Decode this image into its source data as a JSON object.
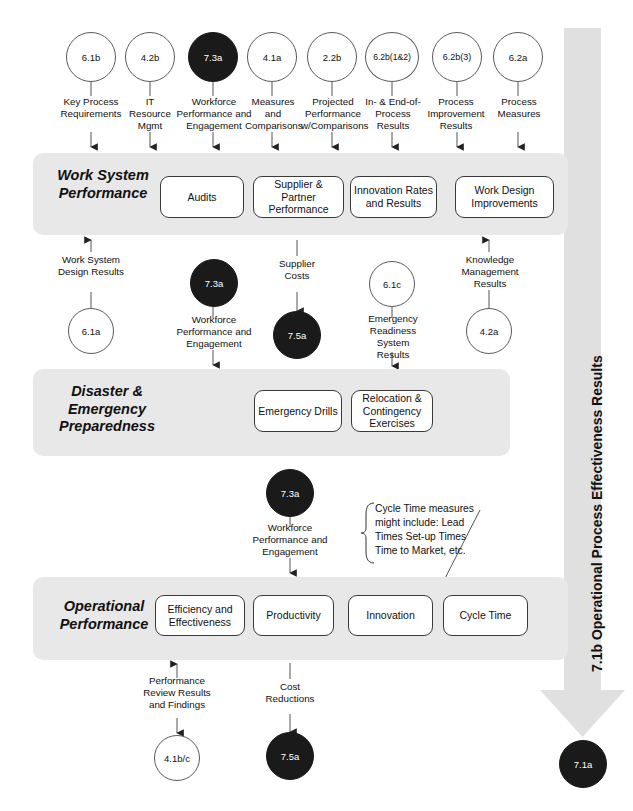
{
  "diagram": {
    "colors": {
      "band_fill": "#e8e8e8",
      "arrow_fill": "#e0e0e0",
      "node_border": "#3a3a3a",
      "circle_open_fill": "#ffffff",
      "circle_filled_fill": "#1a1a1a",
      "line": "#555555"
    }
  },
  "top_circles": [
    {
      "id": "c-6-1b",
      "label": "6.1b",
      "filled": false
    },
    {
      "id": "c-4-2b",
      "label": "4.2b",
      "filled": false
    },
    {
      "id": "c-7-3a-top",
      "label": "7.3a",
      "filled": true
    },
    {
      "id": "c-4-1a",
      "label": "4.1a",
      "filled": false
    },
    {
      "id": "c-2-2b",
      "label": "2.2b",
      "filled": false
    },
    {
      "id": "c-6-2b12",
      "label": "6.2b(1&2)",
      "filled": false
    },
    {
      "id": "c-6-2b3",
      "label": "6.2b(3)",
      "filled": false
    },
    {
      "id": "c-6-2a",
      "label": "6.2a",
      "filled": false
    }
  ],
  "top_captions": [
    {
      "id": "cap-key-process",
      "text": "Key Process Requirements"
    },
    {
      "id": "cap-it-resource",
      "text": "IT Resource Mgmt"
    },
    {
      "id": "cap-workforce-1",
      "text": "Workforce Performance and Engagement"
    },
    {
      "id": "cap-measures",
      "text": "Measures and Comparisons"
    },
    {
      "id": "cap-projected",
      "text": "Projected Performance w/Comparisons"
    },
    {
      "id": "cap-in-end-process",
      "text": "In- & End-of-Process Results"
    },
    {
      "id": "cap-process-improvement",
      "text": "Process Improvement Results"
    },
    {
      "id": "cap-process-measures",
      "text": "Process Measures"
    }
  ],
  "bands": [
    {
      "id": "band-work-system",
      "label": "Work System Performance",
      "nodes": [
        {
          "id": "node-audits",
          "label": "Audits"
        },
        {
          "id": "node-supplier-partner",
          "label": "Supplier & Partner Performance"
        },
        {
          "id": "node-innovation-rates",
          "label": "Innovation Rates and Results"
        },
        {
          "id": "node-work-design",
          "label": "Work Design Improvements"
        }
      ]
    },
    {
      "id": "band-disaster-emergency",
      "label": "Disaster & Emergency Preparedness",
      "nodes": [
        {
          "id": "node-emergency-drills",
          "label": "Emergency Drills"
        },
        {
          "id": "node-relocation",
          "label": "Relocation & Contingency Exercises"
        }
      ]
    },
    {
      "id": "band-operational",
      "label": "Operational Performance",
      "nodes": [
        {
          "id": "node-efficiency",
          "label": "Efficiency and Effectiveness"
        },
        {
          "id": "node-productivity",
          "label": "Productivity"
        },
        {
          "id": "node-innovation",
          "label": "Innovation"
        },
        {
          "id": "node-cycle-time",
          "label": "Cycle Time"
        }
      ]
    }
  ],
  "mid_section_1": {
    "captions": [
      {
        "id": "cap-work-system-design",
        "text": "Work System Design Results"
      },
      {
        "id": "cap-workforce-2",
        "text": "Workforce Performance and Engagement"
      },
      {
        "id": "cap-supplier-costs",
        "text": "Supplier Costs"
      },
      {
        "id": "cap-emergency-readiness",
        "text": "Emergency Readiness System Results"
      },
      {
        "id": "cap-knowledge-mgmt",
        "text": "Knowledge Management Results"
      }
    ],
    "circles": [
      {
        "id": "c-6-1a",
        "label": "6.1a",
        "filled": false
      },
      {
        "id": "c-7-3a-mid",
        "label": "7.3a",
        "filled": true
      },
      {
        "id": "c-7-5a-mid",
        "label": "7.5a",
        "filled": true
      },
      {
        "id": "c-6-1c",
        "label": "6.1c",
        "filled": false
      },
      {
        "id": "c-4-2a",
        "label": "4.2a",
        "filled": false
      }
    ]
  },
  "mid_section_2": {
    "circles": [
      {
        "id": "c-7-3a-low",
        "label": "7.3a",
        "filled": true
      }
    ],
    "captions": [
      {
        "id": "cap-workforce-3",
        "text": "Workforce Performance and Engagement"
      }
    ],
    "note": {
      "id": "note-cycle-time",
      "lines": [
        "Cycle Time measures",
        "might include: Lead",
        "Times Set-up Times",
        "Time to Market, etc."
      ]
    }
  },
  "bottom_section": {
    "captions": [
      {
        "id": "cap-performance-review",
        "text": "Performance Review Results and Findings"
      },
      {
        "id": "cap-cost-reductions",
        "text": "Cost Reductions"
      }
    ],
    "circles": [
      {
        "id": "c-4-1bc",
        "label": "4.1b/c",
        "filled": false
      },
      {
        "id": "c-7-5a-bottom",
        "label": "7.5a",
        "filled": true
      },
      {
        "id": "c-7-1a",
        "label": "7.1a",
        "filled": true
      }
    ]
  },
  "vertical_arrow": {
    "id": "arrow-operational-results",
    "label": "7.1b Operational Process Effectiveness Results"
  }
}
